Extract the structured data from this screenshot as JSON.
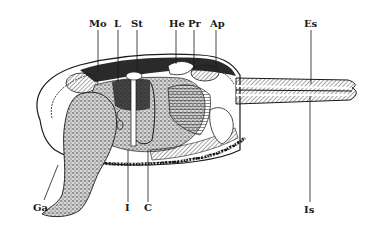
{
  "figure": {
    "colors": {
      "ink": "#1a1a1a",
      "paper": "#ffffff",
      "shade": "#8a8a8a"
    },
    "labels_top": [
      {
        "id": "Mo",
        "text": "Mo",
        "x": 95,
        "y": 19,
        "line_x": 98,
        "line_to": 70
      },
      {
        "id": "L",
        "text": "L",
        "x": 116,
        "y": 19,
        "line_x": 118,
        "line_to": 80
      },
      {
        "id": "St",
        "text": "St",
        "x": 133,
        "y": 19,
        "line_x": 137,
        "line_to": 65
      },
      {
        "id": "He",
        "text": "He",
        "x": 169,
        "y": 19,
        "line_x": 176,
        "line_to": 62
      },
      {
        "id": "Pr",
        "text": "Pr",
        "x": 191,
        "y": 19,
        "line_x": 194,
        "line_to": 68
      },
      {
        "id": "Ap",
        "text": "Ap",
        "x": 211,
        "y": 19,
        "line_x": 216,
        "line_to": 65
      },
      {
        "id": "Es",
        "text": "Es",
        "x": 304,
        "y": 19,
        "line_x": 311,
        "line_to": 80
      }
    ],
    "labels_bottom": [
      {
        "id": "Ga",
        "text": "Ga",
        "x": 33,
        "y": 204,
        "line_from_x": 55,
        "line_from_y": 170,
        "line_x": 42,
        "line_y": 200
      },
      {
        "id": "I",
        "text": "I",
        "x": 127,
        "y": 204,
        "line_x": 128,
        "line_from_y": 165
      },
      {
        "id": "C",
        "text": "C",
        "x": 146,
        "y": 204,
        "line_x": 148,
        "line_from_y": 165
      },
      {
        "id": "Is",
        "text": "Is",
        "x": 304,
        "y": 204,
        "line_x": 310,
        "line_from_y": 95
      }
    ]
  }
}
